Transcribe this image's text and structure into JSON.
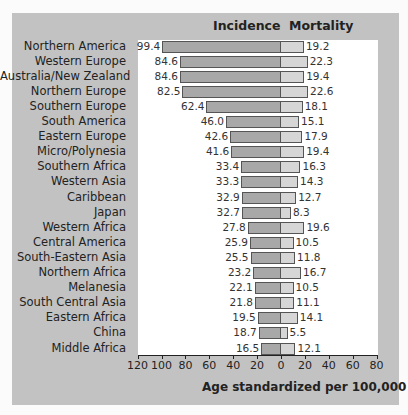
{
  "chart_data": {
    "type": "bar",
    "orientation": "horizontal-diverging",
    "title": "",
    "xlabel": "Age standardized per 100,000",
    "ylabel": "",
    "left_axis_ticks": [
      "120",
      "100",
      "80",
      "60",
      "40",
      "20",
      "0"
    ],
    "right_axis_ticks": [
      "20",
      "40",
      "60",
      "80"
    ],
    "xlim_left": [
      0,
      120
    ],
    "xlim_right": [
      0,
      80
    ],
    "grid": false,
    "legend": [
      "Incidence",
      "Mortality"
    ],
    "categories": [
      "Northern America",
      "Western Europe",
      "Australia/New Zealand",
      "Northern Europe",
      "Southern Europe",
      "South America",
      "Eastern Europe",
      "Micro/Polynesia",
      "Southern Africa",
      "Western Asia",
      "Caribbean",
      "Japan",
      "Western Africa",
      "Central America",
      "South-Eastern Asia",
      "Northern Africa",
      "Melanesia",
      "South Central Asia",
      "Eastern Africa",
      "China",
      "Middle Africa"
    ],
    "series": [
      {
        "name": "Incidence",
        "values": [
          99.4,
          84.6,
          84.6,
          82.5,
          62.4,
          46.0,
          42.6,
          41.6,
          33.4,
          33.3,
          32.9,
          32.7,
          27.8,
          25.9,
          25.5,
          23.2,
          22.1,
          21.8,
          19.5,
          18.7,
          16.5
        ]
      },
      {
        "name": "Mortality",
        "values": [
          19.2,
          22.3,
          19.4,
          22.6,
          18.1,
          15.1,
          17.9,
          19.4,
          16.3,
          14.3,
          12.7,
          8.3,
          19.6,
          10.5,
          11.8,
          16.7,
          10.5,
          11.1,
          14.1,
          5.5,
          12.1
        ]
      }
    ],
    "value_labels_incidence": [
      "99.4",
      "84.6",
      "84.6",
      "82.5",
      "62.4",
      "46.0",
      "42.6",
      "41.6",
      "33.4",
      "33.3",
      "32.9",
      "32.7",
      "27.8",
      "25.9",
      "25.5",
      "23.2",
      "22.1",
      "21.8",
      "19.5",
      "18.7",
      "16.5"
    ],
    "value_labels_mortality": [
      "19.2",
      "22.3",
      "19.4",
      "22.6",
      "18.1",
      "15.1",
      "17.9",
      "19.4",
      "16.3",
      "14.3",
      "12.7",
      "8.3",
      "19.6",
      "10.5",
      "11.8",
      "16.7",
      "10.5",
      "11.1",
      "14.1",
      "5.5",
      "12.1"
    ]
  },
  "headers": {
    "incidence": "Incidence",
    "mortality": "Mortality"
  },
  "colors": {
    "incidence": "#a8a8a8",
    "mortality": "#d6d6d6",
    "panel": "#c2c2c2",
    "plot": "#ffffff"
  }
}
